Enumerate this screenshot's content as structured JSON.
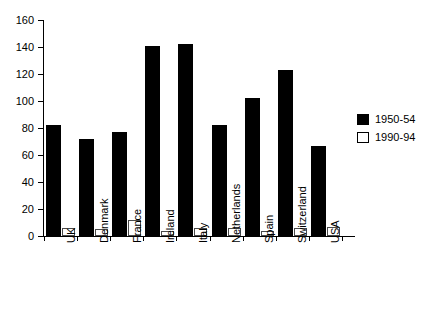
{
  "chart_data": {
    "type": "bar",
    "title": "",
    "subtitle": "",
    "xlabel": "",
    "ylabel": "",
    "ylim": [
      0,
      160
    ],
    "ytick_step": 20,
    "yticks": [
      "0",
      "20",
      "40",
      "60",
      "80",
      "100",
      "120",
      "140",
      "160"
    ],
    "grid": false,
    "legend_position": "right",
    "categories": [
      "UK",
      "Denmark",
      "France",
      "Ireland",
      "Italy",
      "Netherlands",
      "Spain",
      "Switzerland",
      "USA"
    ],
    "series": [
      {
        "name": "1950-54",
        "color": "#000000",
        "style": "filled",
        "values": [
          82,
          72,
          77,
          141,
          142,
          82,
          102,
          123,
          67
        ]
      },
      {
        "name": "1990-94",
        "color": "#ffffff",
        "style": "hollow",
        "values": [
          6,
          5,
          12,
          4,
          6,
          6,
          4,
          6,
          7
        ]
      }
    ]
  },
  "legend": {
    "entries": [
      {
        "label": "1950-54",
        "swatch": "filled-square-icon"
      },
      {
        "label": "1990-94",
        "swatch": "hollow-square-icon"
      }
    ]
  }
}
